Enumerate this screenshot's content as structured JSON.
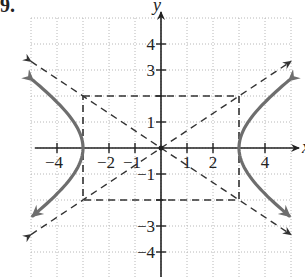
{
  "figure_label": "9.",
  "chart_data": {
    "type": "line",
    "title": "",
    "xlabel": "x",
    "ylabel": "y",
    "xlim": [
      -5,
      5
    ],
    "ylim": [
      -5,
      5
    ],
    "grid": true,
    "x_tick_labels": [
      "-4",
      "-2",
      "-1",
      "1",
      "2",
      "4"
    ],
    "y_tick_labels": [
      "4",
      "3",
      "1",
      "-1",
      "-3",
      "-4"
    ],
    "vertices": [
      [
        -3,
        0
      ],
      [
        3,
        0
      ]
    ],
    "central_rectangle": {
      "x": [
        -3,
        3
      ],
      "y": [
        -2,
        2
      ]
    },
    "asymptotes": [
      {
        "name": "y = (2/3)x",
        "from": [
          -5,
          -3.33
        ],
        "to": [
          5,
          3.33
        ]
      },
      {
        "name": "y = -(2/3)x",
        "from": [
          -5,
          3.33
        ],
        "to": [
          5,
          -3.33
        ]
      }
    ],
    "series": [
      {
        "name": "right branch",
        "style": "solid gray",
        "points": [
          [
            5,
            2.67
          ],
          [
            4,
            1.76
          ],
          [
            3.5,
            1.2
          ],
          [
            3,
            0
          ],
          [
            3.5,
            -1.2
          ],
          [
            4,
            -1.76
          ],
          [
            5,
            -2.67
          ]
        ]
      },
      {
        "name": "left branch",
        "style": "solid gray",
        "points": [
          [
            -5,
            2.67
          ],
          [
            -4,
            1.76
          ],
          [
            -3.5,
            1.2
          ],
          [
            -3,
            0
          ],
          [
            -3.5,
            -1.2
          ],
          [
            -4,
            -1.76
          ],
          [
            -5,
            -2.67
          ]
        ]
      }
    ]
  },
  "colors": {
    "axis": "#222222",
    "grid": "#b8b8b8",
    "curve": "#6e6e6e",
    "dashed": "#333333"
  }
}
